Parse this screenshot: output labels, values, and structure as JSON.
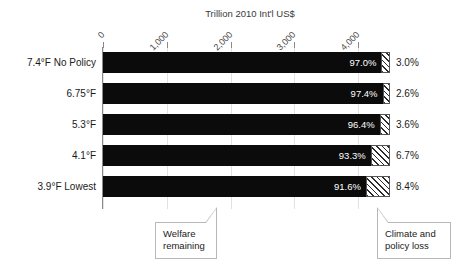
{
  "chart_data": {
    "type": "bar",
    "title": "Trillion 2010 Int'l US$",
    "subtitle": "",
    "xlabel": "Trillion 2010 Int'l US$",
    "ylabel": "",
    "orientation": "horizontal",
    "stacked": true,
    "grid": true,
    "legend_position": "annotations",
    "xlim": [
      0,
      4500
    ],
    "xticks": [
      0,
      1000,
      2000,
      3000,
      4000
    ],
    "xticklabels": [
      "0",
      "1,000",
      "2,000",
      "3,000",
      "4,000"
    ],
    "categories": [
      "7.4°F No Policy",
      "6.75°F",
      "5.3°F",
      "4.1°F",
      "3.9°F Lowest"
    ],
    "series": [
      {
        "name": "Welfare remaining",
        "unit": "%",
        "values": [
          97.0,
          97.4,
          96.4,
          93.3,
          91.6
        ],
        "labels": [
          "97.0%",
          "97.4%",
          "96.4%",
          "93.3%",
          "91.6%"
        ],
        "color": "#0b0b0b",
        "pattern": "solid"
      },
      {
        "name": "Climate and policy loss",
        "unit": "%",
        "values": [
          3.0,
          2.6,
          3.6,
          6.7,
          8.4
        ],
        "labels": [
          "3.0%",
          "2.6%",
          "3.6%",
          "6.7%",
          "8.4%"
        ],
        "color": "#ffffff",
        "pattern": "diagonal-hatch"
      }
    ],
    "bar_total_value": 4500,
    "annotations": [
      {
        "text_line1": "Welfare",
        "text_line2": "remaining"
      },
      {
        "text_line1": "Climate and",
        "text_line2": "policy loss"
      }
    ]
  }
}
